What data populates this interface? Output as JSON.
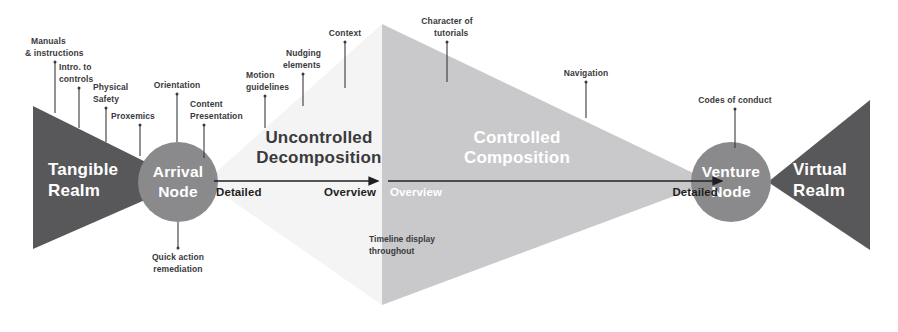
{
  "diagram": {
    "colors": {
      "dark_gray": "#58585a",
      "mid_gray": "#8a8a8c",
      "light_gray": "#dcdcde",
      "pale_gray": "#f2f2f2",
      "text_dark": "#3a3a3c",
      "text_black": "#1f1f21",
      "text_white": "#ffffff",
      "background": "#ffffff"
    },
    "realms": [
      {
        "id": "tangible",
        "line1": "Tangible",
        "line2": "Realm"
      },
      {
        "id": "virtual",
        "line1": "Virtual",
        "line2": "Realm"
      }
    ],
    "nodes": [
      {
        "id": "arrival",
        "line1": "Arrival",
        "line2": "Node"
      },
      {
        "id": "venture",
        "line1": "Venture",
        "line2": "Node"
      }
    ],
    "phases": [
      {
        "id": "uncontrolled",
        "line1": "Uncontrolled",
        "line2": "Decomposition"
      },
      {
        "id": "controlled",
        "line1": "Controlled",
        "line2": "Composition"
      }
    ],
    "axes": [
      {
        "id": "left-axis",
        "start_label": "Detailed",
        "end_label": "Overview"
      },
      {
        "id": "right-axis",
        "start_label": "Overview",
        "end_label": "Detailed"
      }
    ],
    "annotations": [
      {
        "id": "manuals",
        "line1": "Manuals",
        "line2": "& instructions"
      },
      {
        "id": "intro-controls",
        "line1": "Intro. to",
        "line2": "controls"
      },
      {
        "id": "physical-safety",
        "line1": "Physical",
        "line2": "Safety"
      },
      {
        "id": "proxemics",
        "line1": "Proxemics",
        "line2": ""
      },
      {
        "id": "orientation",
        "line1": "Orientation",
        "line2": ""
      },
      {
        "id": "content-presentation",
        "line1": "Content",
        "line2": "Presentation"
      },
      {
        "id": "quick-action",
        "line1": "Quick action",
        "line2": "remediation"
      },
      {
        "id": "motion-guidelines",
        "line1": "Motion",
        "line2": "guidelines"
      },
      {
        "id": "nudging-elements",
        "line1": "Nudging",
        "line2": "elements"
      },
      {
        "id": "context",
        "line1": "Context",
        "line2": ""
      },
      {
        "id": "character-of-tutorials",
        "line1": "Character of",
        "line2": "tutorials"
      },
      {
        "id": "navigation",
        "line1": "Navigation",
        "line2": ""
      },
      {
        "id": "codes-of-conduct",
        "line1": "Codes of conduct",
        "line2": ""
      },
      {
        "id": "timeline-display",
        "line1": "Timeline display",
        "line2": "throughout"
      }
    ]
  }
}
